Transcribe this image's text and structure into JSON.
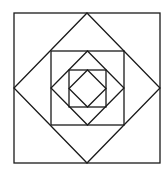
{
  "diagram": {
    "levels": 3,
    "stroke_color": "#1a1a1a",
    "background_color": "#ffffff",
    "shapes": [
      {
        "name": "outer-square",
        "type": "square"
      },
      {
        "name": "outer-diamond",
        "type": "diamond"
      },
      {
        "name": "middle-square",
        "type": "square"
      },
      {
        "name": "middle-diamond",
        "type": "diamond"
      },
      {
        "name": "inner-square",
        "type": "square"
      },
      {
        "name": "inner-diamond",
        "type": "diamond"
      }
    ]
  }
}
